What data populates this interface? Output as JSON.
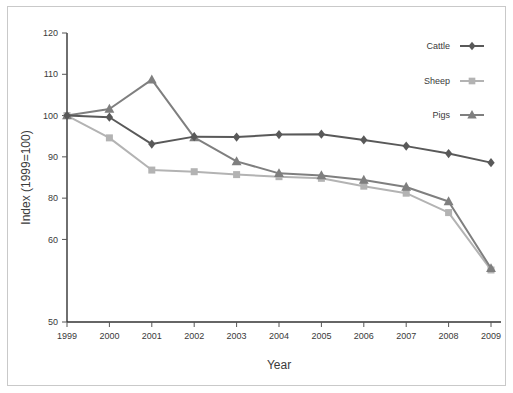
{
  "chart_data": {
    "type": "line",
    "title": "",
    "xlabel": "Year",
    "ylabel": "Index (1999=100)",
    "x": [
      1999,
      2000,
      2001,
      2002,
      2003,
      2004,
      2005,
      2006,
      2007,
      2008,
      2009
    ],
    "categories": [
      "1999",
      "2000",
      "2001",
      "2002",
      "2003",
      "2004",
      "2005",
      "2006",
      "2007",
      "2008",
      "2009"
    ],
    "xtick_labels": [
      "1999",
      "2000",
      "2001",
      "2002",
      "2003",
      "2004",
      "2005",
      "2006",
      "2007",
      "2008",
      "2009"
    ],
    "ytick_labels": [
      "120",
      "110",
      "100",
      "90",
      "80",
      "60",
      "50"
    ],
    "ytick_values": [
      120,
      110,
      100,
      90,
      80,
      70,
      50
    ],
    "ylim": [
      50,
      120
    ],
    "xlim": [
      1999,
      2009
    ],
    "grid": false,
    "legend_position": "top-right",
    "series": [
      {
        "name": "Cattle",
        "color": "#595959",
        "marker": "diamond",
        "values": [
          100.0,
          99.6,
          93.1,
          94.9,
          94.8,
          95.4,
          95.5,
          94.1,
          92.6,
          90.8,
          88.6
        ]
      },
      {
        "name": "Sheep",
        "color": "#b3b3b3",
        "marker": "square",
        "values": [
          100.0,
          94.6,
          86.8,
          86.4,
          85.7,
          85.2,
          84.8,
          82.9,
          81.2,
          76.5,
          62.6
        ]
      },
      {
        "name": "Pigs",
        "color": "#7f7f7f",
        "marker": "triangle",
        "values": [
          100.0,
          101.6,
          108.7,
          94.7,
          88.9,
          86.0,
          85.5,
          84.4,
          82.7,
          79.2,
          63.0
        ]
      }
    ]
  },
  "legend": {
    "items": [
      {
        "label": "Cattle"
      },
      {
        "label": "Sheep"
      },
      {
        "label": "Pigs"
      }
    ]
  },
  "axes": {
    "x_title": "Year",
    "y_title": "Index (1999=100)"
  }
}
